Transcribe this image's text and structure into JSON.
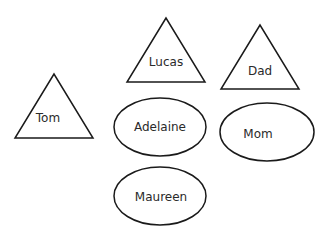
{
  "diagram": {
    "stroke_color": "#1a1a1a",
    "nodes": [
      {
        "id": "lucas",
        "shape": "triangle",
        "label": "Lucas",
        "points": "166,18 127,82 205,82",
        "label_x": 166,
        "label_y": 66
      },
      {
        "id": "dad",
        "shape": "triangle",
        "label": "Dad",
        "points": "260,25 221,89 299,89",
        "label_x": 260,
        "label_y": 75
      },
      {
        "id": "tom",
        "shape": "triangle",
        "label": "Tom",
        "points": "54,74 15,138 93,138",
        "label_x": 48,
        "label_y": 122
      },
      {
        "id": "adelaine",
        "shape": "ellipse",
        "label": "Adelaine",
        "cx": 160,
        "cy": 127,
        "rx": 46,
        "ry": 29,
        "label_x": 160,
        "label_y": 131
      },
      {
        "id": "mom",
        "shape": "ellipse",
        "label": "Mom",
        "cx": 267,
        "cy": 132,
        "rx": 47,
        "ry": 29,
        "label_x": 258,
        "label_y": 138
      },
      {
        "id": "maureen",
        "shape": "ellipse",
        "label": "Maureen",
        "cx": 160,
        "cy": 196,
        "rx": 46,
        "ry": 29,
        "label_x": 161,
        "label_y": 201
      }
    ]
  }
}
